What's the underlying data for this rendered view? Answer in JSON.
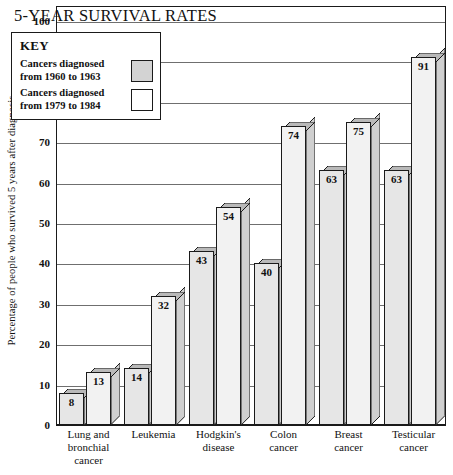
{
  "chart_data": {
    "type": "bar",
    "title": "5-YEAR SURVIVAL RATES",
    "xlabel": "",
    "ylabel": "Percentage of people who survived 5 years after diagnosis",
    "ylim": [
      0,
      100
    ],
    "ytick_step": 10,
    "yticks": [
      0,
      10,
      20,
      30,
      40,
      50,
      60,
      70,
      80,
      90,
      100
    ],
    "grid": true,
    "legend_position": "top-left-inside",
    "categories": [
      "Lung and bronchial cancer",
      "Leukemia",
      "Hodgkin's disease",
      "Colon cancer",
      "Breast cancer",
      "Testicular cancer"
    ],
    "series": [
      {
        "name": "Cancers diagnosed from 1960 to 1963",
        "values": [
          8,
          14,
          43,
          40,
          63,
          63
        ],
        "color": "#e6e6e6"
      },
      {
        "name": "Cancers diagnosed from 1979 to 1984",
        "values": [
          13,
          32,
          54,
          74,
          75,
          91
        ],
        "color": "#f2f2f2"
      }
    ]
  },
  "title": "5-YEAR SURVIVAL RATES",
  "y_axis": {
    "label": "Percentage of people who survived 5 years after diagnosis",
    "ticks": [
      "0",
      "10",
      "20",
      "30",
      "40",
      "50",
      "60",
      "70",
      "80",
      "90",
      "100"
    ]
  },
  "legend": {
    "heading": "KEY",
    "entries": [
      {
        "line1": "Cancers diagnosed",
        "line2": "from 1960 to 1963",
        "swatch": "filled-gray"
      },
      {
        "line1": "Cancers diagnosed",
        "line2": "from 1979 to 1984",
        "swatch": "empty-white"
      }
    ]
  },
  "x_labels": [
    {
      "line1": "Lung and",
      "line2": "bronchial",
      "line3": "cancer"
    },
    {
      "line1": "Leukemia",
      "line2": "",
      "line3": ""
    },
    {
      "line1": "Hodgkin's",
      "line2": "disease",
      "line3": ""
    },
    {
      "line1": "Colon",
      "line2": "cancer",
      "line3": ""
    },
    {
      "line1": "Breast",
      "line2": "cancer",
      "line3": ""
    },
    {
      "line1": "Testicular",
      "line2": "cancer",
      "line3": ""
    }
  ],
  "bar_value_labels": {
    "old": [
      "8",
      "14",
      "43",
      "40",
      "63",
      "63"
    ],
    "new": [
      "13",
      "32",
      "54",
      "74",
      "75",
      "91"
    ]
  },
  "colors": {
    "bar_old_face": "#e6e6e6",
    "bar_new_face": "#f2f2f2",
    "bar_cap": "#b9b9b9",
    "bar_side": "#cfcfcf",
    "outline": "#1a1a1a",
    "gridline": "#6f6f6f",
    "background": "#ffffff"
  }
}
